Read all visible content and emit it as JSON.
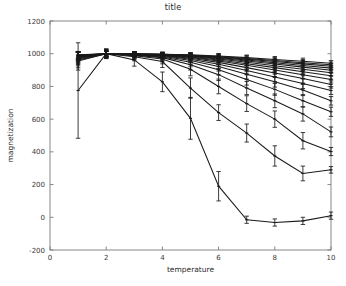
{
  "chart_data": {
    "type": "line",
    "title": "title",
    "xlabel": "temperature",
    "ylabel": "magnetization",
    "xlim": [
      0,
      10
    ],
    "ylim": [
      -200,
      1200
    ],
    "xticks": [
      0,
      2,
      4,
      6,
      8,
      10
    ],
    "yticks": [
      -200,
      0,
      200,
      400,
      600,
      800,
      1000,
      1200
    ],
    "grid": false,
    "legend": null,
    "errorbars": true,
    "line_color": "#1a1a1a",
    "x": [
      1,
      2,
      3,
      4,
      5,
      6,
      7,
      8,
      9,
      10
    ],
    "series": [
      {
        "name": "series-1",
        "values": [
          775,
          1000,
          962,
          828,
          605,
          190,
          -15,
          -32,
          -22,
          10
        ],
        "errors": [
          292,
          30,
          38,
          60,
          128,
          90,
          22,
          22,
          22,
          22
        ]
      },
      {
        "name": "series-2",
        "values": [
          955,
          1000,
          982,
          952,
          790,
          640,
          515,
          375,
          268,
          290
        ],
        "errors": [
          55,
          28,
          25,
          36,
          62,
          48,
          55,
          62,
          45,
          20
        ]
      },
      {
        "name": "series-3",
        "values": [
          962,
          1000,
          988,
          968,
          905,
          800,
          695,
          600,
          468,
          402
        ],
        "errors": [
          48,
          25,
          22,
          30,
          40,
          45,
          48,
          50,
          50,
          25
        ]
      },
      {
        "name": "series-4",
        "values": [
          968,
          1000,
          990,
          976,
          932,
          872,
          790,
          712,
          632,
          522
        ],
        "errors": [
          42,
          24,
          20,
          26,
          32,
          36,
          40,
          42,
          44,
          30
        ]
      },
      {
        "name": "series-5",
        "values": [
          972,
          1000,
          992,
          980,
          948,
          902,
          842,
          782,
          712,
          645
        ],
        "errors": [
          38,
          22,
          18,
          22,
          28,
          32,
          34,
          36,
          38,
          28
        ]
      },
      {
        "name": "series-6",
        "values": [
          975,
          1000,
          993,
          984,
          958,
          922,
          875,
          828,
          778,
          712
        ],
        "errors": [
          35,
          20,
          17,
          20,
          25,
          28,
          30,
          32,
          34,
          26
        ]
      },
      {
        "name": "series-7",
        "values": [
          978,
          1000,
          994,
          987,
          966,
          936,
          898,
          858,
          818,
          775
        ],
        "errors": [
          32,
          19,
          16,
          18,
          22,
          25,
          27,
          29,
          31,
          24
        ]
      },
      {
        "name": "series-8",
        "values": [
          980,
          1000,
          995,
          989,
          972,
          947,
          915,
          882,
          848,
          812
        ],
        "errors": [
          30,
          18,
          15,
          17,
          20,
          23,
          25,
          27,
          28,
          22
        ]
      },
      {
        "name": "series-9",
        "values": [
          982,
          1000,
          996,
          991,
          977,
          956,
          929,
          900,
          872,
          842
        ],
        "errors": [
          28,
          17,
          14,
          16,
          19,
          21,
          23,
          25,
          26,
          21
        ]
      },
      {
        "name": "series-10",
        "values": [
          984,
          1000,
          996,
          992,
          980,
          962,
          939,
          915,
          890,
          865
        ],
        "errors": [
          26,
          16,
          14,
          15,
          18,
          20,
          22,
          23,
          25,
          20
        ]
      },
      {
        "name": "series-11",
        "values": [
          986,
          1000,
          997,
          993,
          983,
          968,
          948,
          927,
          905,
          884
        ],
        "errors": [
          25,
          15,
          13,
          14,
          17,
          19,
          20,
          22,
          23,
          19
        ]
      },
      {
        "name": "series-12",
        "values": [
          988,
          1000,
          997,
          994,
          986,
          972,
          955,
          937,
          918,
          899
        ],
        "errors": [
          24,
          15,
          13,
          14,
          16,
          18,
          19,
          21,
          22,
          18
        ]
      },
      {
        "name": "series-13",
        "values": [
          989,
          1000,
          998,
          995,
          988,
          976,
          961,
          945,
          928,
          912
        ],
        "errors": [
          23,
          14,
          12,
          13,
          15,
          17,
          18,
          20,
          21,
          18
        ]
      },
      {
        "name": "series-14",
        "values": [
          991,
          1000,
          998,
          996,
          990,
          980,
          967,
          952,
          938,
          923
        ],
        "errors": [
          22,
          14,
          12,
          13,
          15,
          16,
          18,
          19,
          20,
          17
        ]
      },
      {
        "name": "series-15",
        "values": [
          992,
          1000,
          999,
          996,
          991,
          983,
          971,
          958,
          945,
          932
        ],
        "errors": [
          21,
          13,
          12,
          12,
          14,
          16,
          17,
          18,
          19,
          17
        ]
      },
      {
        "name": "series-16",
        "values": [
          994,
          1000,
          999,
          997,
          993,
          986,
          976,
          965,
          954,
          942
        ],
        "errors": [
          20,
          13,
          11,
          12,
          14,
          15,
          16,
          18,
          19,
          16
        ]
      }
    ]
  },
  "axes": {
    "frame_color": "#7a7a7a",
    "tick_color": "#7a7a7a"
  }
}
